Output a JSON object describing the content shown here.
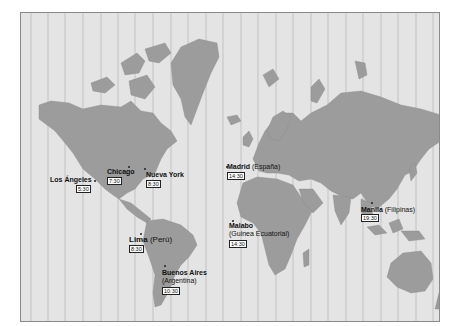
{
  "map": {
    "title": "World time zones",
    "land_color": "#9c9c9c",
    "sea_color": "#e4e4e4",
    "zone_line_color": "#b0b0b0",
    "cities": [
      {
        "name": "Los Ángeles",
        "region": "",
        "time": "5:30"
      },
      {
        "name": "Chicago",
        "region": "",
        "time": "7:30"
      },
      {
        "name": "Nueva York",
        "region": "",
        "time": "8:30"
      },
      {
        "name": "Lima",
        "region": "(Perú)",
        "time": "8:30"
      },
      {
        "name": "Buenos Aires",
        "region": "(Argentina)",
        "time": "10:30"
      },
      {
        "name": "Madrid",
        "region": "(España)",
        "time": "14:30"
      },
      {
        "name": "Malabo",
        "region": "(Guinea Ecuatorial)",
        "time": "14:30"
      },
      {
        "name": "Manila",
        "region": "(Filipinas)",
        "time": "19:30"
      }
    ]
  }
}
